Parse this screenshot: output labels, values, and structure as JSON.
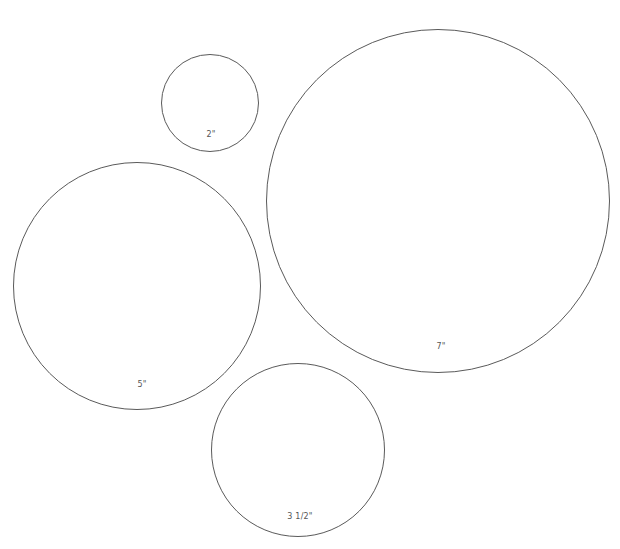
{
  "diagram": {
    "stroke_color": "#5a5a5a",
    "label_color": "#555555",
    "background": "#ffffff",
    "circles": [
      {
        "id": "2in",
        "label": "2\"",
        "cx": 210,
        "cy": 103,
        "r": 49,
        "label_x": 211,
        "label_y": 134
      },
      {
        "id": "5in",
        "label": "5\"",
        "cx": 137,
        "cy": 286,
        "r": 124,
        "label_x": 142,
        "label_y": 384
      },
      {
        "id": "7in",
        "label": "7\"",
        "cx": 438,
        "cy": 201,
        "r": 172,
        "label_x": 441,
        "label_y": 346
      },
      {
        "id": "3-5in",
        "label": "3 1/2\"",
        "cx": 298,
        "cy": 450,
        "r": 87,
        "label_x": 300,
        "label_y": 516
      }
    ]
  }
}
